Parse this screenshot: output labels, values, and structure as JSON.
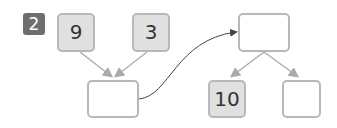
{
  "problem": {
    "number": "2"
  },
  "boxes": {
    "top_left": {
      "value": "9",
      "filled": true
    },
    "top_middle": {
      "value": "3",
      "filled": true
    },
    "sum_box": {
      "value": "",
      "filled": false
    },
    "top_right": {
      "value": "",
      "filled": false
    },
    "bottom_left": {
      "value": "10",
      "filled": true
    },
    "bottom_right": {
      "value": "",
      "filled": false
    }
  },
  "colors": {
    "badge": "#6e6e6e",
    "filled_box": "#e0e0e0",
    "border": "#b8b8b8",
    "arrow": "#aaaaaa",
    "curve": "#444444"
  }
}
